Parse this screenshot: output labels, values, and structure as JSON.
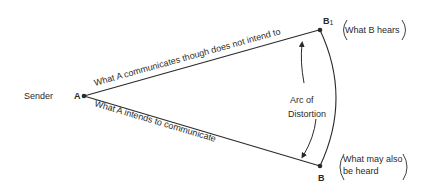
{
  "diagram": {
    "sender_label": "Sender",
    "point_a": "A",
    "point_b1": "B",
    "point_b1_sub": "1",
    "point_b": "B",
    "upper_line_label": "What A communicates though does not intend to",
    "lower_line_label": "What A intends to communicate",
    "arc_label_line1": "Arc of",
    "arc_label_line2": "Distortion",
    "b1_note": "What B hears",
    "b_note_line1": "What may also",
    "b_note_line2": "be heard",
    "colors": {
      "ink": "#2a2a2a",
      "background": "#ffffff"
    }
  }
}
